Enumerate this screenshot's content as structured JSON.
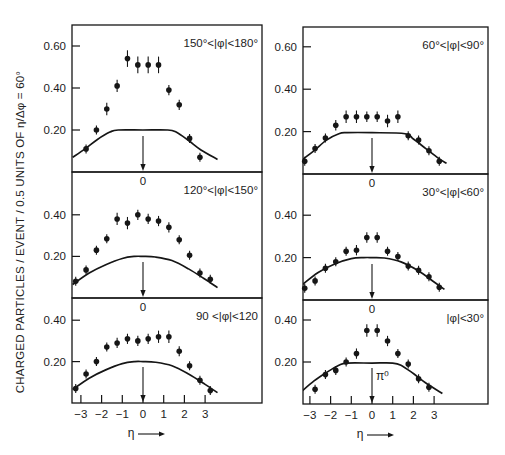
{
  "figure": {
    "y_axis_label": "CHARGED  PARTICLES / EVENT / 0.5 UNITS OF η/Δφ = 60°",
    "x_axis_label": "η",
    "x_arrow": "⟶",
    "pi0_label": "π⁰"
  },
  "chart_data": [
    {
      "type": "scatter",
      "panel": "top-left",
      "title": "150°<|φ|<180°",
      "xlabel": "",
      "ylabel": "charged particles / event / 0.5 units of η",
      "ylim": [
        0,
        0.7
      ],
      "yticks": [
        0.2,
        0.4,
        0.6
      ],
      "ytick_labels": [
        "0.20",
        "0.40",
        "0.60"
      ],
      "xlim": [
        -3.4,
        5.7
      ],
      "x_center_label": "0",
      "points": {
        "x": [
          -2.75,
          -2.25,
          -1.75,
          -1.25,
          -0.75,
          -0.25,
          0.25,
          0.75,
          1.25,
          1.75,
          2.25,
          2.75
        ],
        "y": [
          0.11,
          0.2,
          0.3,
          0.41,
          0.54,
          0.51,
          0.51,
          0.51,
          0.39,
          0.32,
          0.16,
          0.07
        ],
        "err": [
          0.01,
          0.01,
          0.02,
          0.02,
          0.03,
          0.03,
          0.03,
          0.03,
          0.015,
          0.015,
          0.01,
          0.005
        ]
      },
      "curve": {
        "x": [
          -3.4,
          -2.8,
          -2.2,
          -1.6,
          -1.2,
          0,
          1.2,
          1.6,
          2.2,
          2.8,
          3.6
        ],
        "y": [
          0.07,
          0.11,
          0.155,
          0.19,
          0.2,
          0.2,
          0.2,
          0.19,
          0.15,
          0.105,
          0.06
        ]
      },
      "arrow_at": 0
    },
    {
      "type": "scatter",
      "panel": "top-right",
      "title": "60°<|φ|<90°",
      "ylim": [
        0,
        0.7
      ],
      "yticks": [
        0.2,
        0.4,
        0.6
      ],
      "ytick_labels": [
        "0.20",
        "0.40",
        "0.60"
      ],
      "xlim": [
        -3.4,
        5.5
      ],
      "x_center_label": "0",
      "points": {
        "x": [
          -3.25,
          -2.75,
          -2.25,
          -1.75,
          -1.25,
          -0.75,
          -0.25,
          0.25,
          0.75,
          1.25,
          1.75,
          2.25,
          2.75,
          3.25
        ],
        "y": [
          0.06,
          0.12,
          0.17,
          0.23,
          0.27,
          0.27,
          0.27,
          0.27,
          0.25,
          0.27,
          0.18,
          0.16,
          0.11,
          0.06
        ],
        "err": [
          0.005,
          0.01,
          0.01,
          0.015,
          0.02,
          0.02,
          0.015,
          0.015,
          0.02,
          0.02,
          0.01,
          0.01,
          0.01,
          0.005
        ]
      },
      "curve": {
        "x": [
          -3.4,
          -2.8,
          -2.2,
          -1.6,
          -1.2,
          0,
          1.6,
          2.0,
          2.6,
          3.2,
          3.6
        ],
        "y": [
          0.065,
          0.11,
          0.16,
          0.19,
          0.195,
          0.195,
          0.19,
          0.165,
          0.12,
          0.075,
          0.05
        ]
      },
      "arrow_at": 0
    },
    {
      "type": "scatter",
      "panel": "middle-left",
      "title": "120°<|φ|<150°",
      "ylim": [
        0,
        0.6
      ],
      "yticks": [
        0.2,
        0.4
      ],
      "ytick_labels": [
        "0.20",
        "0.40"
      ],
      "xlim": [
        -3.4,
        5.7
      ],
      "x_center_label": "0",
      "points": {
        "x": [
          -3.25,
          -2.75,
          -2.25,
          -1.75,
          -1.25,
          -0.75,
          -0.25,
          0.25,
          0.75,
          1.25,
          1.75,
          2.25,
          2.75,
          3.25
        ],
        "y": [
          0.08,
          0.135,
          0.23,
          0.285,
          0.38,
          0.36,
          0.4,
          0.38,
          0.37,
          0.34,
          0.28,
          0.205,
          0.12,
          0.09
        ],
        "err": [
          0.005,
          0.01,
          0.01,
          0.01,
          0.02,
          0.02,
          0.015,
          0.015,
          0.015,
          0.015,
          0.01,
          0.01,
          0.005,
          0.005
        ]
      },
      "curve": {
        "x": [
          -3.4,
          -2.6,
          -1.8,
          -1.0,
          -0.4,
          0,
          0.6,
          1.4,
          2.2,
          3.0,
          3.6
        ],
        "y": [
          0.065,
          0.12,
          0.16,
          0.19,
          0.2,
          0.2,
          0.197,
          0.18,
          0.14,
          0.09,
          0.05
        ]
      },
      "arrow_at": 0
    },
    {
      "type": "scatter",
      "panel": "middle-right",
      "title": "30°<|φ|<60°",
      "ylim": [
        0,
        0.6
      ],
      "yticks": [
        0.2,
        0.4
      ],
      "ytick_labels": [
        "0.20",
        "0.40"
      ],
      "xlim": [
        -3.4,
        5.5
      ],
      "x_center_label": "0",
      "points": {
        "x": [
          -3.25,
          -2.75,
          -2.25,
          -1.75,
          -1.25,
          -0.75,
          -0.25,
          0.25,
          0.75,
          1.25,
          1.75,
          2.25,
          2.75,
          3.25
        ],
        "y": [
          0.055,
          0.09,
          0.15,
          0.18,
          0.23,
          0.235,
          0.295,
          0.295,
          0.23,
          0.205,
          0.16,
          0.14,
          0.11,
          0.06
        ],
        "err": [
          0.005,
          0.005,
          0.01,
          0.01,
          0.01,
          0.015,
          0.015,
          0.015,
          0.01,
          0.01,
          0.01,
          0.01,
          0.01,
          0.005
        ]
      },
      "curve": {
        "x": [
          -3.4,
          -2.6,
          -1.8,
          -1.0,
          -0.4,
          0,
          0.6,
          1.4,
          2.2,
          3.0,
          3.5
        ],
        "y": [
          0.07,
          0.13,
          0.17,
          0.195,
          0.2,
          0.2,
          0.198,
          0.18,
          0.14,
          0.085,
          0.05
        ]
      },
      "arrow_at": 0
    },
    {
      "type": "scatter",
      "panel": "bottom-left",
      "title": "90 <|φ|<120",
      "ylim": [
        0,
        0.6
      ],
      "yticks": [
        0.2,
        0.4
      ],
      "ytick_labels": [
        "0.20",
        "0.40"
      ],
      "xlim": [
        -3.4,
        5.7
      ],
      "xticks": [
        -3,
        -2,
        -1,
        0,
        1,
        2,
        3
      ],
      "xtick_labels": [
        "-3",
        "-2",
        "-1",
        "0",
        "1",
        "2",
        "3"
      ],
      "points": {
        "x": [
          -3.25,
          -2.75,
          -2.25,
          -1.75,
          -1.25,
          -0.75,
          -0.25,
          0.25,
          0.75,
          1.25,
          1.75,
          2.25,
          2.75,
          3.25
        ],
        "y": [
          0.07,
          0.14,
          0.2,
          0.27,
          0.29,
          0.31,
          0.3,
          0.31,
          0.32,
          0.32,
          0.25,
          0.18,
          0.11,
          0.06
        ],
        "err": [
          0.005,
          0.01,
          0.01,
          0.01,
          0.015,
          0.015,
          0.015,
          0.015,
          0.02,
          0.02,
          0.015,
          0.01,
          0.005,
          0.005
        ]
      },
      "curve": {
        "x": [
          -3.4,
          -2.6,
          -1.8,
          -1.0,
          -0.4,
          0,
          0.6,
          1.4,
          2.2,
          3.0,
          3.6
        ],
        "y": [
          0.065,
          0.12,
          0.16,
          0.19,
          0.2,
          0.2,
          0.197,
          0.18,
          0.14,
          0.09,
          0.05
        ]
      },
      "arrow_at": 0
    },
    {
      "type": "scatter",
      "panel": "bottom-right",
      "title": "|φ|<30°",
      "ylim": [
        0,
        0.6
      ],
      "yticks": [
        0.2,
        0.4
      ],
      "ytick_labels": [
        "0.20",
        "0.40"
      ],
      "xlim": [
        -3.4,
        5.5
      ],
      "xticks": [
        -3,
        -2,
        -1,
        0,
        1,
        2,
        3
      ],
      "xtick_labels": [
        "-3",
        "-2",
        "-1",
        "0",
        "1",
        "2",
        "3"
      ],
      "points": {
        "x": [
          -2.75,
          -2.25,
          -1.75,
          -1.25,
          -0.75,
          -0.25,
          0.25,
          0.75,
          1.25,
          1.75,
          2.25,
          2.75
        ],
        "y": [
          0.07,
          0.14,
          0.16,
          0.2,
          0.24,
          0.35,
          0.35,
          0.3,
          0.24,
          0.19,
          0.12,
          0.08
        ],
        "err": [
          0.005,
          0.01,
          0.01,
          0.01,
          0.015,
          0.02,
          0.02,
          0.015,
          0.01,
          0.01,
          0.005,
          0.005
        ]
      },
      "curve": {
        "x": [
          -3.4,
          -2.8,
          -2.2,
          -1.6,
          -1.2,
          0,
          1.0,
          1.4,
          2.0,
          2.6,
          3.4
        ],
        "y": [
          0.06,
          0.11,
          0.15,
          0.185,
          0.195,
          0.195,
          0.195,
          0.185,
          0.145,
          0.1,
          0.05
        ]
      },
      "arrow_at": 0,
      "arrow_label": "π⁰"
    }
  ]
}
